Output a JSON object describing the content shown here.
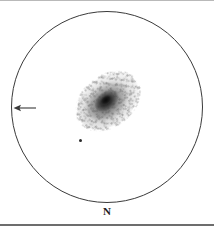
{
  "sketch": {
    "type": "astronomical-eyepiece-sketch",
    "medium": "pencil-on-white",
    "background_color": "#ffffff",
    "ink_color": "#1c1c1c",
    "frame": {
      "width": 214,
      "height": 226,
      "top_border_color": "#b9b9b9",
      "bottom_border_color": "#6d6d6d"
    },
    "field_of_view": {
      "shape": "circle",
      "center_x": 107,
      "center_y": 106,
      "radius": 96,
      "stroke_color": "#3a3a3a",
      "stroke_width": 1
    },
    "objects": [
      {
        "name": "galaxy",
        "label": "",
        "appearance": "diffuse elongated mottled glow with bright condensed nucleus",
        "center_x": 108,
        "center_y": 100,
        "major_axis": 68,
        "minor_axis": 48,
        "position_angle_deg": -38,
        "core_color": "#121212"
      },
      {
        "name": "field-star",
        "label": "",
        "appearance": "small sharp stellar point",
        "center_x": 80,
        "center_y": 139,
        "size": 3,
        "color": "#2a2a2a"
      }
    ],
    "markers": {
      "arrow": {
        "direction": "left",
        "x": 13,
        "y": 101,
        "width": 24,
        "height": 12,
        "color": "#3a3a3a"
      },
      "north_label": "N"
    }
  }
}
